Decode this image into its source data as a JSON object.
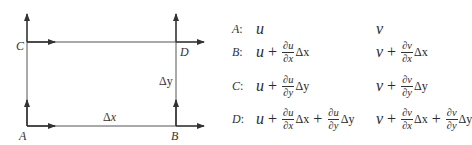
{
  "diagram": {
    "points": {
      "A": {
        "label": "A"
      },
      "B": {
        "label": "B"
      },
      "C": {
        "label": "C"
      },
      "D": {
        "label": "D"
      }
    },
    "dimensions": {
      "dx": {
        "symbol": "Δ",
        "var": "x"
      },
      "dy": {
        "symbol": "Δ",
        "var": "y"
      }
    },
    "colors": {
      "line": "#333333",
      "background": "#ffffff"
    }
  },
  "equations": {
    "separator": ":",
    "rows": [
      {
        "point": "A",
        "u": {
          "base": "u",
          "terms": []
        },
        "v": {
          "base": "v",
          "terms": []
        }
      },
      {
        "point": "B",
        "u": {
          "base": "u",
          "terms": [
            {
              "op": "+",
              "num": "∂u",
              "den": "∂x",
              "delta": "Δx"
            }
          ]
        },
        "v": {
          "base": "v",
          "terms": [
            {
              "op": "+",
              "num": "∂v",
              "den": "∂x",
              "delta": "Δx"
            }
          ]
        }
      },
      {
        "point": "C",
        "u": {
          "base": "u",
          "terms": [
            {
              "op": "+",
              "num": "∂u",
              "den": "∂y",
              "delta": "Δy"
            }
          ]
        },
        "v": {
          "base": "v",
          "terms": [
            {
              "op": "+",
              "num": "∂v",
              "den": "∂y",
              "delta": "Δy"
            }
          ]
        }
      },
      {
        "point": "D",
        "u": {
          "base": "u",
          "terms": [
            {
              "op": "+",
              "num": "∂u",
              "den": "∂x",
              "delta": "Δx"
            },
            {
              "op": "+",
              "num": "∂u",
              "den": "∂y",
              "delta": "Δy"
            }
          ]
        },
        "v": {
          "base": "v",
          "terms": [
            {
              "op": "+",
              "num": "∂v",
              "den": "∂x",
              "delta": "Δx"
            },
            {
              "op": "+",
              "num": "∂v",
              "den": "∂y",
              "delta": "Δy"
            }
          ]
        }
      }
    ]
  }
}
